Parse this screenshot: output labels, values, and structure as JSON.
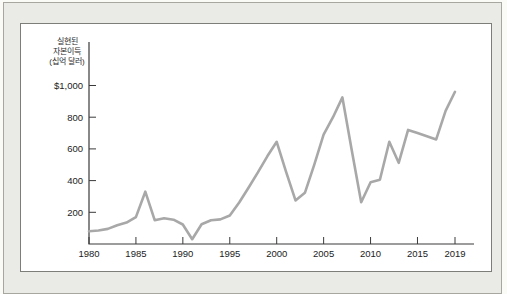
{
  "page": {
    "background": "#fafaf7"
  },
  "frame": {
    "background": "#eaeae6",
    "border_color": "#a7a7a0"
  },
  "panel": {
    "background": "#ffffff",
    "border_color": "#7d7d79"
  },
  "chart_data": {
    "type": "line",
    "title": "",
    "y_axis_title": "실현된 자본이득 (십억 달러)",
    "y_axis_title_lines": [
      "실현된",
      "자본이득",
      "(십억 달러)"
    ],
    "series_name": "실현된 자본이득",
    "years": [
      1980,
      1981,
      1982,
      1983,
      1984,
      1985,
      1986,
      1987,
      1988,
      1989,
      1990,
      1991,
      1992,
      1993,
      1994,
      1995,
      1996,
      1997,
      1998,
      1999,
      2000,
      2001,
      2002,
      2003,
      2004,
      2005,
      2006,
      2007,
      2008,
      2009,
      2010,
      2011,
      2012,
      2013,
      2014,
      2015,
      2016,
      2017,
      2018,
      2019
    ],
    "values": [
      80,
      85,
      95,
      118,
      135,
      170,
      330,
      150,
      163,
      153,
      123,
      30,
      125,
      150,
      155,
      180,
      262,
      355,
      452,
      553,
      645,
      455,
      275,
      323,
      500,
      690,
      800,
      925,
      590,
      263,
      390,
      405,
      645,
      512,
      720,
      700,
      680,
      660,
      840,
      960
    ],
    "x_ticks": {
      "values": [
        1980,
        1985,
        1990,
        1995,
        2000,
        2005,
        2010,
        2015,
        2019
      ],
      "labels": [
        "1980",
        "1985",
        "1990",
        "1995",
        "2000",
        "2005",
        "2010",
        "2015",
        "2019"
      ]
    },
    "y_ticks": {
      "values": [
        1000,
        800,
        600,
        400,
        200
      ],
      "labels": [
        "$1,000",
        "800",
        "600",
        "400",
        "200"
      ]
    },
    "xlim": [
      1980,
      2021
    ],
    "ylim": [
      0,
      1100
    ],
    "grid": false,
    "legend": "none",
    "line_color": "#a8a8a8",
    "axis_color": "#3a3a3a",
    "label_color": "#222222"
  }
}
